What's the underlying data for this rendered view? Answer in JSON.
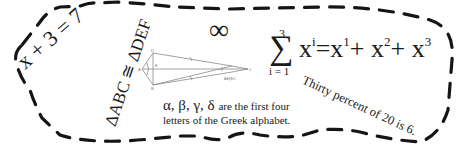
{
  "expressions": {
    "linear_equation": "x + 3 = 7",
    "congruence": "ΔABC ≅ ΔDEF",
    "infinity_symbol": "∞",
    "summation": {
      "sigma": "∑",
      "upper_limit": "3",
      "lower_limit": "i = 1",
      "term_base": "x",
      "term_exp": "i",
      "equals": "=",
      "expansion": [
        {
          "base": "x",
          "exp": "1",
          "op": "+"
        },
        {
          "base": "x",
          "exp": "2",
          "op": "+"
        },
        {
          "base": "x",
          "exp": "3",
          "op": ""
        }
      ]
    },
    "percent_statement": "Thirty percent of 20 is 6.",
    "greek_letters": "α, β, γ, δ",
    "greek_line1_rest": "are the first four",
    "greek_line2": "letters of the Greek alphabet."
  },
  "diagram": {
    "type": "kite",
    "vertex_labels": [
      "A",
      "B",
      "C",
      "D",
      "E"
    ],
    "caption": "AE|EC"
  },
  "colors": {
    "ink": "#1a1a1a",
    "background": "#ffffff",
    "diagram_line": "#8a8a8a"
  }
}
